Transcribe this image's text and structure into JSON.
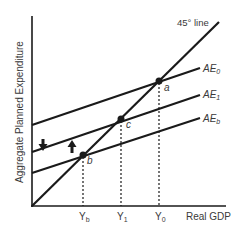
{
  "diagram": {
    "y_axis_label": "Aggregate Planned Expenditure",
    "x_axis_label": "Real GDP",
    "line_45_label": "45° line",
    "curves": [
      {
        "name": "AE",
        "sub": "0",
        "x1": 32,
        "y1": 125,
        "x2": 200,
        "y2": 68
      },
      {
        "name": "AE",
        "sub": "1",
        "x1": 32,
        "y1": 152,
        "x2": 200,
        "y2": 95
      },
      {
        "name": "AE",
        "sub": "b",
        "x1": 32,
        "y1": 173,
        "x2": 200,
        "y2": 118
      }
    ],
    "points": [
      {
        "label": "a",
        "x": 159,
        "y": 81
      },
      {
        "label": "c",
        "x": 121,
        "y": 119
      },
      {
        "label": "b",
        "x": 83,
        "y": 155
      }
    ],
    "x_ticks": [
      {
        "name": "Y",
        "sub": "b",
        "x": 83
      },
      {
        "name": "Y",
        "sub": "1",
        "x": 121
      },
      {
        "name": "Y",
        "sub": "0",
        "x": 159
      }
    ],
    "arrows": [
      {
        "direction": "down",
        "x": 43,
        "y": 146
      },
      {
        "direction": "up",
        "x": 72,
        "y": 146
      }
    ],
    "colors": {
      "line": "#1a1a1a",
      "text": "#3a3a3a",
      "background": "#ffffff"
    }
  }
}
